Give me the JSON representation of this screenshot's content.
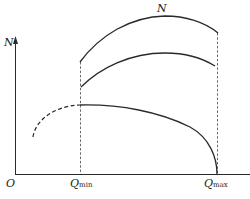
{
  "diagram": {
    "type": "curve-sketch",
    "axis": {
      "y_label": "N",
      "origin_label": "O"
    },
    "x_markers": [
      {
        "base": "Q",
        "sub": "min"
      },
      {
        "base": "Q",
        "sub": "max"
      }
    ],
    "curves": [
      {
        "name": "upper-curve",
        "label": "N"
      },
      {
        "name": "middle-curve",
        "label": ""
      },
      {
        "name": "lower-curve",
        "label": "",
        "dashed_extension": true
      }
    ],
    "colors": {
      "line": "#2a2a2a",
      "dashed": "#444444"
    }
  }
}
